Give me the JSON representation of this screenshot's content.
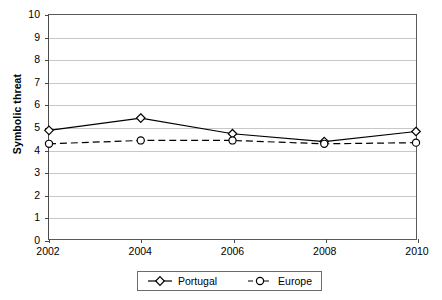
{
  "chart_data": {
    "type": "line",
    "title": "",
    "xlabel": "",
    "ylabel": "Symbolic threat",
    "categories": [
      "2002",
      "2004",
      "2006",
      "2008",
      "2010"
    ],
    "x": [
      2002,
      2004,
      2006,
      2008,
      2010
    ],
    "ylim": [
      0,
      10
    ],
    "xlim": [
      2002,
      2010
    ],
    "y_ticks": [
      0,
      1,
      2,
      3,
      4,
      5,
      6,
      7,
      8,
      9,
      10
    ],
    "y_tick_labels": [
      "0",
      "1",
      "2",
      "3",
      "4",
      "5",
      "6",
      "7",
      "8",
      "9",
      "10"
    ],
    "grid": true,
    "grid_axis": "y",
    "legend_position": "bottom",
    "series": [
      {
        "name": "Portugal",
        "values": [
          4.85,
          5.4,
          4.7,
          4.35,
          4.8
        ],
        "line_style": "solid",
        "marker": "diamond",
        "color": "#000000"
      },
      {
        "name": "Europe",
        "values": [
          4.25,
          4.4,
          4.4,
          4.25,
          4.3
        ],
        "line_style": "dashed",
        "marker": "circle",
        "color": "#000000"
      }
    ]
  },
  "colors": {
    "background": "#ffffff",
    "gridline": "#c8c8c8",
    "axis": "#4a4a4a",
    "series": "#000000",
    "legend_border": "#6b6b6b"
  }
}
